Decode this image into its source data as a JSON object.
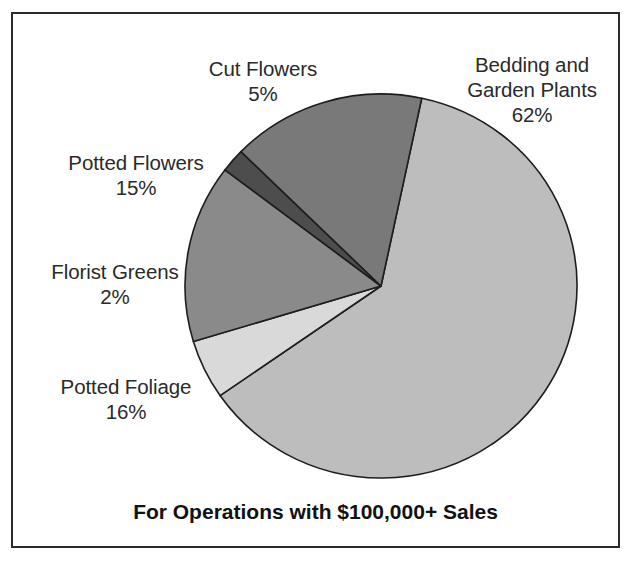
{
  "figure": {
    "caption": "For Operations with $100,000+ Sales",
    "border_color": "#2b2b2b",
    "background": "#ffffff"
  },
  "labels": {
    "bedding": {
      "name_line1": "Bedding and",
      "name_line2": "Garden Plants",
      "pct": "62%"
    },
    "cut_flowers": {
      "name": "Cut Flowers",
      "pct": "5%"
    },
    "potted_flowers": {
      "name": "Potted Flowers",
      "pct": "15%"
    },
    "florist_greens": {
      "name": "Florist Greens",
      "pct": "2%"
    },
    "potted_foliage": {
      "name": "Potted Foliage",
      "pct": "16%"
    }
  },
  "chart_data": {
    "type": "pie",
    "title": "For Operations with $100,000+ Sales",
    "xlabel": "",
    "ylabel": "",
    "units": "percent of sales",
    "legend_position": "outside-labels",
    "grid": false,
    "start_angle_deg": -78,
    "direction": "clockwise",
    "center": {
      "x": 381,
      "y": 286
    },
    "radius": {
      "rx": 196,
      "ry": 192
    },
    "categories": [
      "Bedding and Garden Plants",
      "Cut Flowers",
      "Potted Flowers",
      "Florist Greens",
      "Potted Foliage"
    ],
    "values": [
      62,
      5,
      15,
      2,
      16
    ],
    "slices": [
      {
        "label": "Bedding and Garden Plants",
        "value": 62,
        "display": "62%",
        "color": "#bdbdbd"
      },
      {
        "label": "Cut Flowers",
        "value": 5,
        "display": "5%",
        "color": "#d9d9d9"
      },
      {
        "label": "Potted Flowers",
        "value": 15,
        "display": "15%",
        "color": "#8a8a8a"
      },
      {
        "label": "Florist Greens",
        "value": 2,
        "display": "2%",
        "color": "#4d4d4d"
      },
      {
        "label": "Potted Foliage",
        "value": 16,
        "display": "16%",
        "color": "#797979"
      }
    ]
  }
}
